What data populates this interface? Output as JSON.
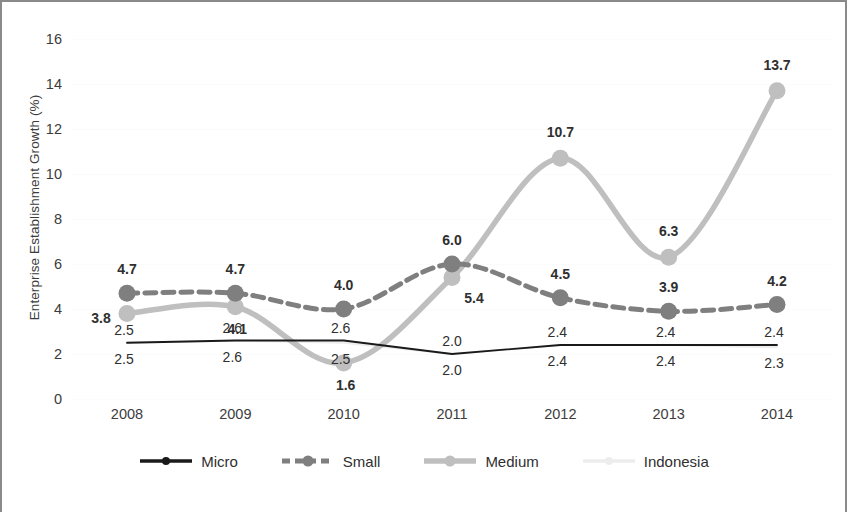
{
  "chart_data": {
    "type": "line",
    "title": "",
    "xlabel": "",
    "ylabel": "Enterprise Establishment Growth (%)",
    "categories": [
      "2008",
      "2009",
      "2010",
      "2011",
      "2012",
      "2013",
      "2014"
    ],
    "ylim": [
      0,
      16
    ],
    "yticks": [
      0,
      2,
      4,
      6,
      8,
      10,
      12,
      14,
      16
    ],
    "ytick_labels": [
      "0",
      "2",
      "4",
      "6",
      "8",
      "10",
      "12",
      "14",
      "16"
    ],
    "grid": true,
    "legend_position": "bottom",
    "series": [
      {
        "name": "Micro",
        "color": "#1a1a1a",
        "style": "solid",
        "values": [
          2.5,
          2.6,
          2.6,
          2.0,
          2.4,
          2.4,
          2.4
        ],
        "labels": [
          "2.5",
          "2.6",
          "2.6",
          "2.0",
          "2.4",
          "2.4",
          "2.4"
        ]
      },
      {
        "name": "Small",
        "color": "#7f7f7f",
        "style": "dashed",
        "values": [
          4.7,
          4.7,
          4.0,
          6.0,
          4.5,
          3.9,
          4.2
        ],
        "labels": [
          "4.7",
          "4.7",
          "4.0",
          "6.0",
          "4.5",
          "3.9",
          "4.2"
        ]
      },
      {
        "name": "Medium",
        "color": "#bfbfbf",
        "style": "solid",
        "values": [
          3.8,
          4.1,
          1.6,
          5.4,
          10.7,
          6.3,
          13.7
        ],
        "labels": [
          "3.8",
          "4.1",
          "1.6",
          "5.4",
          "10.7",
          "6.3",
          "13.7"
        ]
      },
      {
        "name": "Indonesia",
        "color": "#ededed",
        "style": "solid",
        "values": [
          2.5,
          2.6,
          2.5,
          2.0,
          2.4,
          2.4,
          2.3
        ],
        "labels": [
          "2.5",
          "2.6",
          "2.5",
          "2.0",
          "2.4",
          "2.4",
          "2.3"
        ]
      }
    ]
  },
  "legend": {
    "items": [
      {
        "label": "Micro"
      },
      {
        "label": "Small"
      },
      {
        "label": "Medium"
      },
      {
        "label": "Indonesia"
      }
    ]
  }
}
